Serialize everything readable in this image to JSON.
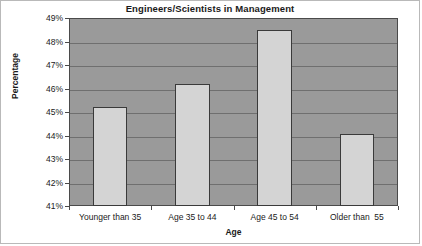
{
  "chart_data": {
    "type": "bar",
    "title": "Engineers/Scientists in Management",
    "xlabel": "Age",
    "ylabel": "Percentage",
    "categories": [
      "Younger than 35",
      "Age 35 to 44",
      "Age 45 to 54",
      "Older than  55"
    ],
    "values": [
      45.2,
      46.2,
      48.5,
      44.05
    ],
    "ylim": [
      41,
      49
    ],
    "ytick_step": 1,
    "ytick_labels": [
      "41%",
      "42%",
      "43%",
      "44%",
      "45%",
      "46%",
      "47%",
      "48%",
      "49%"
    ],
    "ytick_values": [
      41,
      42,
      43,
      44,
      45,
      46,
      47,
      48,
      49
    ],
    "grid": true,
    "legend": false,
    "colors": {
      "plot_background": "#9a9a9a",
      "gridline": "#6f6f6f",
      "bar_fill": "#d4d4d4",
      "bar_border": "#3a3a3a",
      "axis": "#4a4a4a",
      "text": "#1a1a1a",
      "figure_background": "#ffffff"
    }
  }
}
